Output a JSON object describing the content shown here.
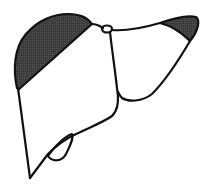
{
  "figure": {
    "colors": {
      "background": "#ffffff",
      "outline": "#111111",
      "shaded_region": "#3a3a3a"
    },
    "regions": [
      {
        "id": "left-superior-shaded-region",
        "shaded": true
      },
      {
        "id": "right-tip-shaded-region",
        "shaded": true
      },
      {
        "id": "right-lobe",
        "shaded": false
      },
      {
        "id": "left-lobe",
        "shaded": false
      },
      {
        "id": "gallbladder",
        "shaded": false
      }
    ]
  }
}
